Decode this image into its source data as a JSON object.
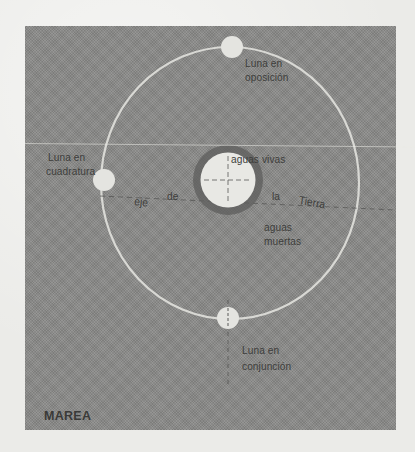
{
  "figure": {
    "title": "MAREA",
    "labels": {
      "moon_opposition": [
        "Luna en",
        "oposición"
      ],
      "moon_quadrature": [
        "Luna en",
        "cuadratura"
      ],
      "moon_conjunction": [
        "Luna en",
        "conjunción"
      ],
      "spring_tides": "aguas vivas",
      "neap_tides": [
        "aguas",
        "muertas"
      ],
      "axis_words": [
        "eje",
        "de",
        "la",
        "Tierra"
      ]
    },
    "colors": {
      "panel": "#8d8d8b",
      "page": "#ebebe8",
      "orbit": "#e6e6e2",
      "earth": "#e8e8e4",
      "earth_halo": "#5e5e5c",
      "text": "#3d3d3b"
    }
  }
}
